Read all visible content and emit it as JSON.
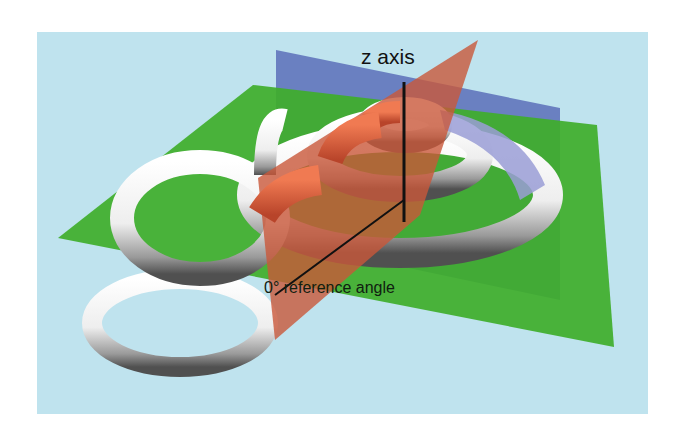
{
  "diagram": {
    "type": "3d-knot-reference-planes",
    "background_color": "#bfe3ee",
    "labels": {
      "z_axis": "z axis",
      "reference_angle": "0° reference angle"
    },
    "planes": [
      {
        "name": "horizontal-plane",
        "color": "#3fae2a"
      },
      {
        "name": "vertical-plane-blue",
        "color": "#5a6fb8"
      },
      {
        "name": "vertical-plane-red",
        "color": "#c9573a"
      }
    ],
    "tube": {
      "color": "#f4f4f4",
      "highlight_red": "#e0643e",
      "shade_blue": "#9a9ed6"
    }
  }
}
